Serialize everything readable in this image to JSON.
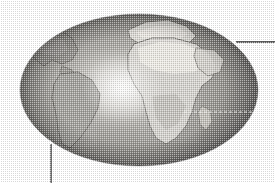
{
  "figure": {
    "background_color": "#ffffff",
    "width": 275,
    "height": 183
  },
  "globe": {
    "name": "earth-globe",
    "shape": "ellipse",
    "center_x": 139,
    "center_y": 90,
    "radius_x": 119,
    "radius_y": 76,
    "base_color": "#8d8d8d",
    "shadow_color": "#5a5a5a",
    "highlight_color": "#f2f2f0",
    "outline_color": "#6f6f6f",
    "specular_highlight": {
      "name": "specular-highlight",
      "center_x": 122,
      "center_y": 88,
      "radius_x": 40,
      "radius_y": 34,
      "color": "#f4f4f2"
    }
  },
  "landmasses": [
    {
      "name": "africa",
      "label": "Africa",
      "fill": "#d9d7d2",
      "stroke": "#6d6b66",
      "centroid_x": 164,
      "centroid_y": 78
    },
    {
      "name": "europe",
      "label": "Europe",
      "fill": "#dedcd6",
      "stroke": "#6d6b66",
      "centroid_x": 155,
      "centroid_y": 36
    },
    {
      "name": "south-america",
      "label": "South America",
      "fill": "#9e9c97",
      "stroke": "#5d5b57",
      "centroid_x": 70,
      "centroid_y": 100
    },
    {
      "name": "north-america",
      "label": "North America",
      "fill": "#8f8d88",
      "stroke": "#5d5b57",
      "centroid_x": 48,
      "centroid_y": 52
    },
    {
      "name": "arabia",
      "label": "Arabian Peninsula",
      "fill": "#cfcdc7",
      "stroke": "#6d6b66",
      "centroid_x": 203,
      "centroid_y": 62
    },
    {
      "name": "madagascar",
      "label": "Madagascar",
      "fill": "#c6c4be",
      "stroke": "#6d6b66",
      "centroid_x": 207,
      "centroid_y": 118
    }
  ],
  "annotations": {
    "equator_line": {
      "name": "equator-dashed-line",
      "style": "dashed",
      "color": "#f0efe9",
      "x_start": 184,
      "x_end": 255,
      "y": 112,
      "dash_pattern": "3 2"
    },
    "leader_lines": [
      {
        "name": "callout-leader-right",
        "orientation": "horizontal",
        "color": "#2b2b2b",
        "x_start": 236,
        "y_start": 42,
        "x_end": 275,
        "y_end": 42
      },
      {
        "name": "callout-leader-bottom-left",
        "orientation": "vertical",
        "color": "#3a3a3a",
        "x_start": 51,
        "y_start": 144,
        "x_end": 51,
        "y_end": 183
      }
    ]
  }
}
